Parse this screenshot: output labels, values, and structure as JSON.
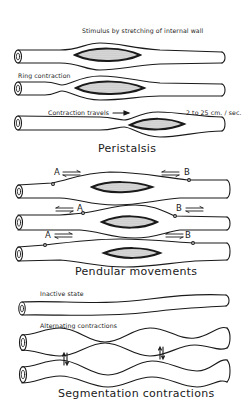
{
  "peristalsis": {
    "title": "Peristalsis",
    "labels": {
      "stimulus": "Stimulus by stretching of internal wall",
      "ring": "Ring contraction",
      "travels": "Contraction travels",
      "speed": "2 to 25 cm. / sec."
    }
  },
  "pendular": {
    "title": "Pendular movements",
    "point_a": "A",
    "point_b": "B"
  },
  "segmentation": {
    "title": "Segmentation contractions",
    "labels": {
      "inactive": "Inactive state",
      "alternating": "Alternating contractions"
    }
  },
  "colors": {
    "line": "#1a1a1a",
    "bolus_fill": "#cfcfcf",
    "background": "#ffffff"
  }
}
